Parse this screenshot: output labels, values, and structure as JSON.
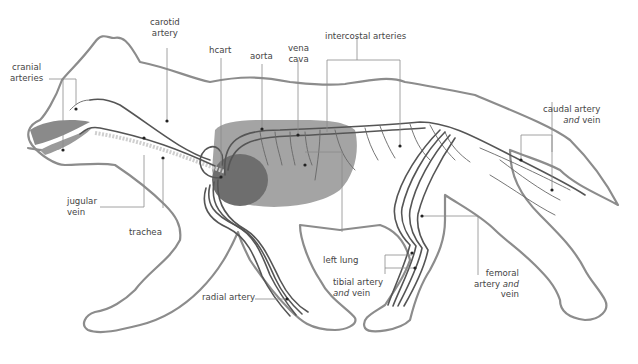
{
  "diagram": {
    "colors": {
      "outline": "#8c8c8c",
      "vessel": "#555555",
      "lung": "#9a9a9a",
      "heart": "#6e6e6e",
      "label_text": "#444444",
      "background": "#ffffff"
    },
    "labels": {
      "cranial_arteries": {
        "line1": "cranial",
        "line2": "arteries"
      },
      "carotid_artery": {
        "line1": "carotid",
        "line2": "artery"
      },
      "heart": {
        "line1": "hcart"
      },
      "aorta": {
        "line1": "aorta"
      },
      "vena_cava": {
        "line1": "vena",
        "line2": "cava"
      },
      "intercostal_arteries": {
        "line1": "intercostal arteries"
      },
      "caudal_artery_vein": {
        "line1": "caudal artery",
        "line2_italic": "and",
        "line2_rest": " vein"
      },
      "jugular_vein": {
        "line1": "jugular",
        "line2": "vein"
      },
      "trachea": {
        "line1": "trachea"
      },
      "left_lung": {
        "line1": "left lung"
      },
      "radial_artery": {
        "line1": "radial artery"
      },
      "tibial_artery_vein": {
        "line1": "tibial artery",
        "line2_italic": "and",
        "line2_rest": " vein"
      },
      "femoral_artery_vein": {
        "line1": "femoral",
        "line2_pre": "artery ",
        "line2_italic": "and",
        "line3": "vein"
      }
    }
  }
}
